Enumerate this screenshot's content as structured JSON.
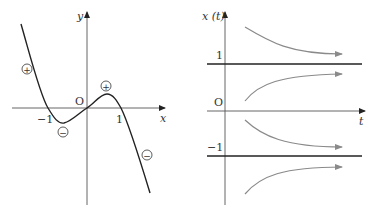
{
  "left_graph": {
    "y_axis_label": "y",
    "x_axis_label": "x",
    "origin_label": "O",
    "tick_neg_one": "−1",
    "tick_one": "1",
    "signs": [
      "+",
      "−",
      "+",
      "−"
    ],
    "colors": {
      "axis": "#333333",
      "curve": "#222222"
    }
  },
  "right_graph": {
    "y_axis_label": "x (t)",
    "t_axis_label": "t",
    "origin_label": "O",
    "level_one_label": "1",
    "level_neg_one_label": "−1",
    "colors": {
      "axis": "#333333",
      "equilibrium": "#222222",
      "trajectory": "#8a8a8a"
    }
  }
}
